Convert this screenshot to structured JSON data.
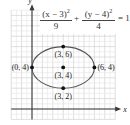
{
  "chart_data": {
    "type": "scatter",
    "subtype": "conic-ellipse",
    "title": "",
    "equation": {
      "term1": {
        "numerator": "(x − 3)",
        "exponent": "2",
        "denominator": "9"
      },
      "plus": "+",
      "term2": {
        "numerator": "(y − 4)",
        "exponent": "2",
        "denominator": "4"
      },
      "rhs": "= 1"
    },
    "ellipse": {
      "center": [
        3,
        4
      ],
      "a": 3,
      "b": 2
    },
    "points": [
      {
        "x": 0,
        "y": 4,
        "label": "(0, 4)"
      },
      {
        "x": 6,
        "y": 4,
        "label": "(6, 4)"
      },
      {
        "x": 3,
        "y": 6,
        "label": "(3, 6)"
      },
      {
        "x": 3,
        "y": 4,
        "label": "(3, 4)"
      },
      {
        "x": 3,
        "y": 2,
        "label": "(3, 2)"
      }
    ],
    "xlabel": "x",
    "ylabel": "y",
    "xlim": [
      -2,
      8
    ],
    "ylim": [
      -1,
      9.5
    ],
    "grid": true,
    "legend": null
  },
  "colors": {
    "grid_major": "#c9c9c9",
    "grid_minor": "#e4e4e4",
    "axis": "#3a3a3a",
    "curve": "#555555",
    "point": "#111111",
    "text": "#222222"
  }
}
